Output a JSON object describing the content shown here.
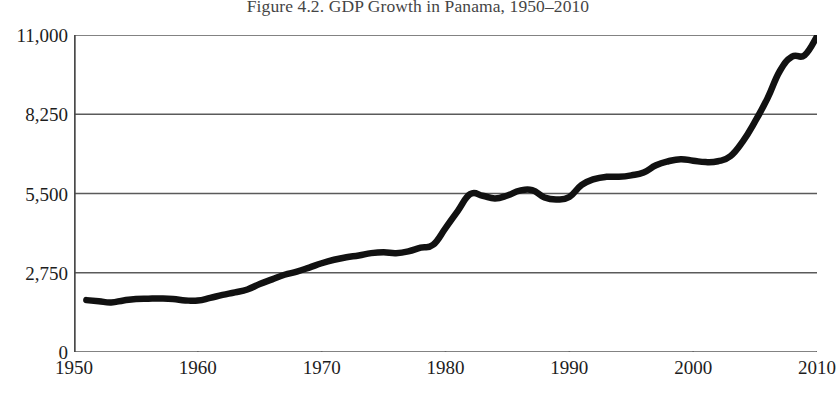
{
  "figure": {
    "title": "Figure 4.2. GDP Growth in Panama, 1950–2010"
  },
  "axes": {
    "y_ticks": [
      {
        "label": "11,000",
        "value": 11000
      },
      {
        "label": "8,250",
        "value": 8250
      },
      {
        "label": "5,500",
        "value": 5500
      },
      {
        "label": "2,750",
        "value": 2750
      },
      {
        "label": "0",
        "value": 0
      }
    ],
    "x_ticks": [
      {
        "label": "1950",
        "value": 1950
      },
      {
        "label": "1960",
        "value": 1960
      },
      {
        "label": "1970",
        "value": 1970
      },
      {
        "label": "1980",
        "value": 1980
      },
      {
        "label": "1990",
        "value": 1990
      },
      {
        "label": "2000",
        "value": 2000
      },
      {
        "label": "2010",
        "value": 2010
      }
    ]
  },
  "style": {
    "line_color": "#111111",
    "gridline_color": "#5a5a5a",
    "axis_color": "#4a4a4a",
    "background": "#ffffff",
    "line_width": 6.5
  },
  "chart_data": {
    "type": "line",
    "title": "Figure 4.2. GDP Growth in Panama, 1950–2010",
    "subtitle": "",
    "xlabel": "",
    "ylabel": "",
    "xlim": [
      1950,
      2010
    ],
    "ylim": [
      0,
      11000
    ],
    "grid": true,
    "grid_axis": "y",
    "legend": false,
    "legend_position": "none",
    "annotations": [],
    "series": [
      {
        "name": "GDP per capita, Panama",
        "x": [
          1951,
          1952,
          1953,
          1954,
          1955,
          1956,
          1957,
          1958,
          1959,
          1960,
          1961,
          1962,
          1963,
          1964,
          1965,
          1966,
          1967,
          1968,
          1969,
          1970,
          1971,
          1972,
          1973,
          1974,
          1975,
          1976,
          1977,
          1978,
          1979,
          1980,
          1981,
          1982,
          1983,
          1984,
          1985,
          1986,
          1987,
          1988,
          1989,
          1990,
          1991,
          1992,
          1993,
          1994,
          1995,
          1996,
          1997,
          1998,
          1999,
          2000,
          2001,
          2002,
          2003,
          2004,
          2005,
          2006,
          2007,
          2008,
          2009,
          2010
        ],
        "values": [
          1800,
          1760,
          1720,
          1790,
          1840,
          1850,
          1855,
          1840,
          1790,
          1785,
          1880,
          1980,
          2070,
          2170,
          2360,
          2520,
          2680,
          2790,
          2930,
          3080,
          3200,
          3290,
          3350,
          3430,
          3460,
          3430,
          3490,
          3620,
          3720,
          4300,
          4900,
          5480,
          5420,
          5330,
          5430,
          5600,
          5620,
          5360,
          5290,
          5380,
          5800,
          6000,
          6080,
          6080,
          6130,
          6230,
          6480,
          6620,
          6690,
          6640,
          6590,
          6620,
          6790,
          7300,
          8000,
          8800,
          9750,
          10250,
          10300,
          10950
        ]
      }
    ]
  }
}
